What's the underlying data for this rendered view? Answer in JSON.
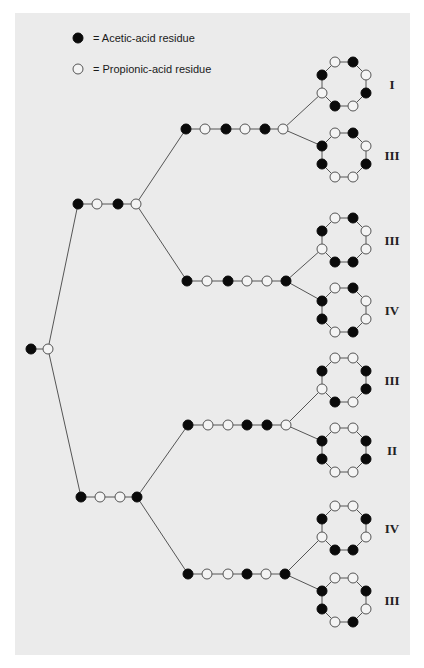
{
  "legend": {
    "acetic": {
      "symbol": "filled-circle",
      "label": "= Acetic-acid residue"
    },
    "propionic": {
      "symbol": "open-circle",
      "label": "= Propionic-acid residue"
    }
  },
  "colors": {
    "panel": "#ebebeb",
    "acetic": "#0a0a0a",
    "propionic": "#f4f4f4",
    "line": "#555555"
  },
  "tree": {
    "dimer": {
      "y": 349,
      "nodes": [
        {
          "x": 31,
          "type": "A"
        },
        {
          "x": 48,
          "type": "P"
        }
      ]
    },
    "tetramers": [
      {
        "id": "tetramer-upper",
        "y": 204,
        "nodes": [
          {
            "x": 78,
            "type": "A"
          },
          {
            "x": 97,
            "type": "P"
          },
          {
            "x": 118,
            "type": "A"
          },
          {
            "x": 136,
            "type": "P"
          }
        ]
      },
      {
        "id": "tetramer-lower",
        "y": 497,
        "nodes": [
          {
            "x": 81,
            "type": "A"
          },
          {
            "x": 100,
            "type": "P"
          },
          {
            "x": 120,
            "type": "P"
          },
          {
            "x": 137,
            "type": "A"
          }
        ]
      }
    ],
    "hexamers": [
      {
        "id": "hexamer-1",
        "parent": 0,
        "y": 129,
        "nodes": [
          {
            "x": 186,
            "type": "A"
          },
          {
            "x": 205,
            "type": "P"
          },
          {
            "x": 226,
            "type": "A"
          },
          {
            "x": 245,
            "type": "P"
          },
          {
            "x": 265,
            "type": "A"
          },
          {
            "x": 283,
            "type": "P"
          }
        ]
      },
      {
        "id": "hexamer-2",
        "parent": 0,
        "y": 281,
        "nodes": [
          {
            "x": 187,
            "type": "A"
          },
          {
            "x": 207,
            "type": "P"
          },
          {
            "x": 228,
            "type": "A"
          },
          {
            "x": 247,
            "type": "P"
          },
          {
            "x": 267,
            "type": "P"
          },
          {
            "x": 286,
            "type": "A"
          }
        ]
      },
      {
        "id": "hexamer-3",
        "parent": 1,
        "y": 425,
        "nodes": [
          {
            "x": 188,
            "type": "A"
          },
          {
            "x": 208,
            "type": "P"
          },
          {
            "x": 228,
            "type": "P"
          },
          {
            "x": 247,
            "type": "A"
          },
          {
            "x": 267,
            "type": "A"
          },
          {
            "x": 286,
            "type": "P"
          }
        ]
      },
      {
        "id": "hexamer-4",
        "parent": 1,
        "y": 574,
        "nodes": [
          {
            "x": 188,
            "type": "A"
          },
          {
            "x": 207,
            "type": "P"
          },
          {
            "x": 228,
            "type": "P"
          },
          {
            "x": 247,
            "type": "A"
          },
          {
            "x": 266,
            "type": "P"
          },
          {
            "x": 285,
            "type": "A"
          }
        ]
      }
    ],
    "rings": [
      {
        "id": "ring-1",
        "parent": 0,
        "cx": 344,
        "cy": 84,
        "attach": 6,
        "label": "I",
        "vertices": [
          "P",
          "A",
          "P",
          "A",
          "P",
          "A",
          "P",
          "A"
        ]
      },
      {
        "id": "ring-2",
        "parent": 0,
        "cx": 344,
        "cy": 155,
        "attach": 7,
        "label": "III",
        "vertices": [
          "P",
          "A",
          "P",
          "A",
          "P",
          "P",
          "A",
          "A"
        ]
      },
      {
        "id": "ring-3",
        "parent": 1,
        "cx": 344,
        "cy": 240,
        "attach": 6,
        "label": "III",
        "vertices": [
          "P",
          "A",
          "P",
          "P",
          "A",
          "A",
          "P",
          "A"
        ]
      },
      {
        "id": "ring-4",
        "parent": 1,
        "cx": 344,
        "cy": 310,
        "attach": 7,
        "label": "IV",
        "vertices": [
          "P",
          "A",
          "P",
          "P",
          "A",
          "P",
          "A",
          "A"
        ]
      },
      {
        "id": "ring-5",
        "parent": 2,
        "cx": 344,
        "cy": 380,
        "attach": 6,
        "label": "III",
        "vertices": [
          "P",
          "P",
          "A",
          "A",
          "P",
          "A",
          "P",
          "A"
        ]
      },
      {
        "id": "ring-6",
        "parent": 2,
        "cx": 344,
        "cy": 450,
        "attach": 7,
        "label": "II",
        "vertices": [
          "P",
          "P",
          "A",
          "A",
          "P",
          "P",
          "A",
          "A"
        ]
      },
      {
        "id": "ring-7",
        "parent": 3,
        "cx": 344,
        "cy": 528,
        "attach": 6,
        "label": "IV",
        "vertices": [
          "P",
          "P",
          "A",
          "P",
          "A",
          "A",
          "P",
          "A"
        ]
      },
      {
        "id": "ring-8",
        "parent": 3,
        "cx": 344,
        "cy": 600,
        "attach": 7,
        "label": "III",
        "vertices": [
          "P",
          "P",
          "A",
          "P",
          "A",
          "P",
          "A",
          "A"
        ]
      }
    ]
  }
}
